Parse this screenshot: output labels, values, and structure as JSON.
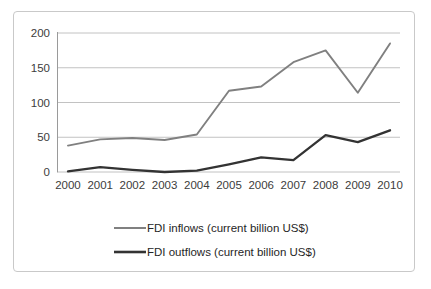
{
  "chart_data": {
    "type": "line",
    "title": "",
    "xlabel": "",
    "ylabel": "",
    "categories": [
      "2000",
      "2001",
      "2002",
      "2003",
      "2004",
      "2005",
      "2006",
      "2007",
      "2008",
      "2009",
      "2010"
    ],
    "series": [
      {
        "name": "FDI inflows  (current billion US$)",
        "color": "#808080",
        "values": [
          38,
          47,
          49,
          46,
          54,
          117,
          123,
          158,
          175,
          114,
          185
        ]
      },
      {
        "name": "FDI outflows (current billion US$)",
        "color": "#333333",
        "values": [
          1,
          7,
          3,
          0,
          2,
          11,
          21,
          17,
          53,
          43,
          60
        ]
      }
    ],
    "ylim": [
      0,
      200
    ],
    "y_ticks": [
      "0",
      "50",
      "100",
      "150",
      "200"
    ],
    "y_tick_values": [
      0,
      50,
      100,
      150,
      200
    ],
    "grid": true,
    "legend_position": "bottom"
  },
  "legend": {
    "entries": [
      {
        "label": "FDI inflows  (current billion US$)",
        "color": "#808080"
      },
      {
        "label": "FDI outflows (current billion US$)",
        "color": "#333333"
      }
    ]
  },
  "colors": {
    "frame_border": "#c9c9c9",
    "gridline": "#b3b3b3",
    "axis": "#9a9a9a",
    "background": "#ffffff",
    "text": "#3c3c3c"
  }
}
